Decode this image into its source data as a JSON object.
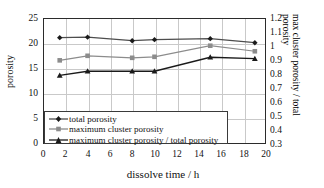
{
  "chart_data": {
    "type": "line",
    "title": "",
    "xlabel": "dissolve time / h",
    "ylabel": "porosity",
    "ylabel_right": "max cluster porosity / total porosity",
    "x": [
      1.5,
      4,
      8,
      10,
      15,
      19
    ],
    "xlim": [
      0,
      20
    ],
    "ylim": [
      0,
      25
    ],
    "ylim_right": [
      0.3,
      1.2
    ],
    "xticks": [
      "0",
      "2",
      "4",
      "6",
      "8",
      "10",
      "12",
      "14",
      "16",
      "18",
      "20"
    ],
    "yticks_left": [
      "0",
      "5",
      "10",
      "15",
      "20",
      "25"
    ],
    "yticks_right": [
      "0.3",
      "0.4",
      "0.5",
      "0.6",
      "0.7",
      "0.8",
      "0.9",
      "1",
      "1.1",
      "1.2"
    ],
    "grid": true,
    "legend_position": "lower-left",
    "series": [
      {
        "name": "total porosity",
        "axis": "left",
        "marker": "diamond",
        "color": "#4d4d4d",
        "values": [
          21.1,
          21.2,
          20.5,
          20.7,
          20.9,
          20.1
        ]
      },
      {
        "name": "maximum cluster porosity",
        "axis": "left",
        "marker": "square",
        "color": "#8c8c8c",
        "values": [
          16.6,
          17.5,
          17.1,
          17.3,
          19.5,
          18.4
        ]
      },
      {
        "name": "maximum cluster porosity / total porosity",
        "axis": "right",
        "marker": "triangle",
        "color": "#1a1a1a",
        "values": [
          0.79,
          0.82,
          0.82,
          0.82,
          0.92,
          0.91
        ]
      }
    ]
  },
  "axes": {
    "left_title": "porosity",
    "right_title": "max cluster porosity / total porosity",
    "bottom_title": "dissolve time / h"
  },
  "legend": {
    "items": [
      {
        "label": "total porosity"
      },
      {
        "label": "maximum cluster porosity"
      },
      {
        "label": "maximum cluster porosity / total porosity"
      }
    ]
  },
  "colors": {
    "series1": "#4d4d4d",
    "series2": "#8c8c8c",
    "series3": "#1a1a1a",
    "grid": "#c9c9c9",
    "frame": "#2b2b2b"
  }
}
